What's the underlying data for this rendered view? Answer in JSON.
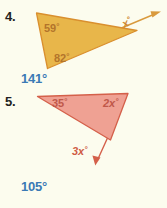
{
  "page": {
    "background_color": "#fcfcee",
    "problems": [
      {
        "number": "4.",
        "figure": {
          "shape": "triangle",
          "fill_color": "#e8b64a",
          "stroke_color": "#d98f2e",
          "interior_angles": [
            {
              "name": "angle-59",
              "label": "59",
              "degree_symbol": "°"
            },
            {
              "name": "angle-82",
              "label": "82",
              "degree_symbol": "°"
            }
          ],
          "exterior_angle": {
            "name": "angle-x",
            "label": "x",
            "degree_symbol": "°"
          },
          "has_ray_arrow": true
        },
        "answer": "141°",
        "answer_color": "#3a7ab5"
      },
      {
        "number": "5.",
        "figure": {
          "shape": "triangle",
          "fill_color": "#efa193",
          "stroke_color": "#d4604a",
          "interior_angles": [
            {
              "name": "angle-35",
              "label": "35",
              "degree_symbol": "°"
            },
            {
              "name": "angle-2x",
              "label": "2x",
              "degree_symbol": "°"
            }
          ],
          "exterior_angle": {
            "name": "angle-3x",
            "label": "3x",
            "degree_symbol": "°"
          },
          "has_ray_arrow": true
        },
        "answer": "105°",
        "answer_color": "#3a7ab5"
      }
    ]
  }
}
